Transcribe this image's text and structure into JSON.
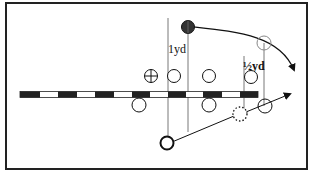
{
  "diagram": {
    "type": "football-play",
    "labels": {
      "one_yard": "1yd",
      "half_yard": "½yd"
    },
    "colors": {
      "stroke": "#111111",
      "fill_dark": "#333333",
      "light_stroke": "#888888",
      "background": "#ffffff"
    },
    "line_of_scrimmage": {
      "x_start": 20,
      "x_end": 258,
      "segments": 13
    },
    "players": [
      {
        "id": "filled-player",
        "shape": "filled-circle",
        "x": 188,
        "y": 27
      },
      {
        "id": "target-open-player",
        "shape": "light-open-circle",
        "x": 264,
        "y": 43
      },
      {
        "id": "center-player",
        "shape": "crosshair-circle",
        "x": 151,
        "y": 76
      },
      {
        "id": "top-player-1",
        "shape": "open-circle",
        "x": 174,
        "y": 76
      },
      {
        "id": "top-player-2",
        "shape": "open-circle",
        "x": 209,
        "y": 76
      },
      {
        "id": "top-player-3",
        "shape": "open-circle",
        "x": 251,
        "y": 77
      },
      {
        "id": "bottom-player-1",
        "shape": "open-circle",
        "x": 139,
        "y": 105
      },
      {
        "id": "bottom-player-2",
        "shape": "open-circle",
        "x": 209,
        "y": 105
      },
      {
        "id": "dotted-player",
        "shape": "dotted-circle",
        "x": 240,
        "y": 114
      },
      {
        "id": "right-bottom-player",
        "shape": "open-circle",
        "x": 265,
        "y": 106
      },
      {
        "id": "bold-player",
        "shape": "bold-open-circle",
        "x": 167,
        "y": 143
      }
    ]
  }
}
